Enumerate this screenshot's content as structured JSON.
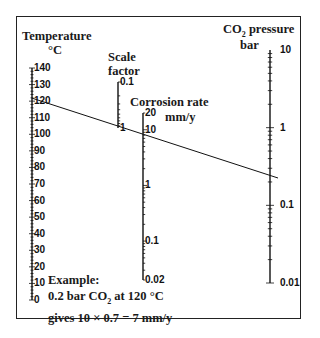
{
  "chart_data": {
    "type": "nomogram",
    "title": "",
    "axes": [
      {
        "name": "Temperature",
        "unit": "°C",
        "scale": "linear",
        "ticks": [
          "140",
          "130",
          "120",
          "110",
          "100",
          "90",
          "80",
          "70",
          "60",
          "50",
          "40",
          "30",
          "20",
          "10",
          "0"
        ],
        "range": [
          0,
          140
        ]
      },
      {
        "name": "Scale factor",
        "unit": "",
        "scale": "log",
        "ticks": [
          "0.1",
          "1"
        ],
        "range": [
          0.1,
          1
        ]
      },
      {
        "name": "Corrosion rate",
        "unit": "mm/y",
        "scale": "log",
        "ticks": [
          "20",
          "10",
          "1",
          "0.1",
          "0.02"
        ],
        "range": [
          0.02,
          20
        ]
      },
      {
        "name": "CO2 pressure",
        "unit": "bar",
        "scale": "log",
        "ticks": [
          "10",
          "1",
          "0.1",
          "0.01"
        ],
        "range": [
          0.01,
          10
        ]
      }
    ],
    "example_line": {
      "temperature_c": 120,
      "co2_pressure_bar": 0.2,
      "corrosion_rate_mm_y": 10,
      "scale_factor": 0.7,
      "result_mm_y": 7
    }
  },
  "labels": {
    "temperature_title": "Temperature",
    "temperature_unit": "°C",
    "scale_title": "Scale",
    "scale_title2": "factor",
    "corrosion_title": "Corrosion rate",
    "corrosion_unit": "mm/y",
    "co2_title_pre": "CO",
    "co2_title_sub": "2",
    "co2_title_post": " pressure",
    "co2_unit": "bar"
  },
  "example": {
    "line1": "Example:",
    "line2_pre": "0.2 bar CO",
    "line2_sub": "2",
    "line2_post": " at 120 °C",
    "line3": "gives 10 × 0.7 = 7 mm/y"
  }
}
